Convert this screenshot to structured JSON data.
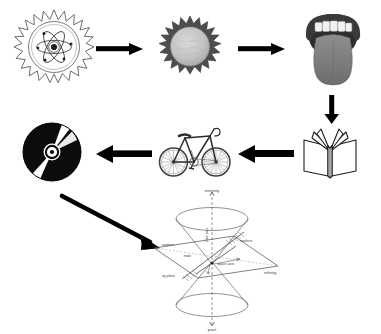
{
  "diagram": {
    "type": "concept-flow",
    "background": "#ffffff",
    "ink": "#000000",
    "title": "",
    "nodes": [
      {
        "id": "atom",
        "name": "atom-starburst-icon",
        "label": "atom",
        "x": 14,
        "y": 8,
        "w": 80,
        "h": 78,
        "style": "line-art-gray"
      },
      {
        "id": "sun",
        "name": "sun-icon",
        "label": "sun",
        "x": 158,
        "y": 16,
        "w": 64,
        "h": 62,
        "style": "gray-filled"
      },
      {
        "id": "mouth",
        "name": "mouth-tongue-icon",
        "label": "mouth",
        "x": 304,
        "y": 8,
        "w": 58,
        "h": 82,
        "style": "gray-filled"
      },
      {
        "id": "book",
        "name": "open-book-icon",
        "label": "open book",
        "x": 302,
        "y": 126,
        "w": 56,
        "h": 54,
        "style": "outline"
      },
      {
        "id": "bicycle",
        "name": "bicycle-icon",
        "label": "bicycle",
        "x": 158,
        "y": 120,
        "w": 74,
        "h": 60,
        "style": "line-art-gray"
      },
      {
        "id": "cd",
        "name": "compact-disc-icon",
        "label": "compact disc",
        "x": 22,
        "y": 122,
        "w": 60,
        "h": 60,
        "style": "black-filled"
      },
      {
        "id": "lightcone",
        "name": "light-cone-diagram",
        "label": "light cone",
        "x": 148,
        "y": 186,
        "w": 136,
        "h": 146,
        "style": "line-art-gray"
      }
    ],
    "arrows": [
      {
        "id": "a1",
        "name": "arrow-atom-to-sun",
        "from": "atom",
        "to": "sun",
        "direction": "right"
      },
      {
        "id": "a2",
        "name": "arrow-sun-to-mouth",
        "from": "sun",
        "to": "mouth",
        "direction": "right"
      },
      {
        "id": "a3",
        "name": "arrow-mouth-to-book",
        "from": "mouth",
        "to": "book",
        "direction": "down"
      },
      {
        "id": "a4",
        "name": "arrow-book-to-bicycle",
        "from": "book",
        "to": "bicycle",
        "direction": "left"
      },
      {
        "id": "a5",
        "name": "arrow-bicycle-to-cd",
        "from": "bicycle",
        "to": "cd",
        "direction": "left"
      },
      {
        "id": "a6",
        "name": "arrow-cd-to-lightcone",
        "from": "cd",
        "to": "lightcone",
        "direction": "down-right"
      }
    ]
  },
  "light_cone": {
    "labels": {
      "top": "eternity",
      "bottom": "past",
      "right": "infinity",
      "center": "now",
      "time_axis": "time axis",
      "space_axis": "space axis",
      "plane": "xy-plane",
      "nowhere_left": "nowhere",
      "nowhere_right": "nowhere",
      "hypersurface": "hypersurface"
    }
  }
}
